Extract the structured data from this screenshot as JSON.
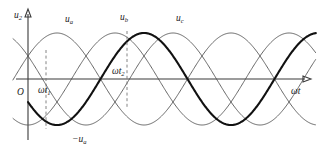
{
  "figure": {
    "title": "",
    "axes": {
      "y_label": "u",
      "y_label_sub": "2",
      "x_label": "ωt",
      "origin_label": "O"
    },
    "curve_labels": [
      {
        "name": "u",
        "sub": "a",
        "x": 69,
        "y": 22
      },
      {
        "name": "u",
        "sub": "b",
        "x": 124,
        "y": 20
      },
      {
        "name": "u",
        "sub": "c",
        "x": 180,
        "y": 21
      }
    ],
    "markers": [
      {
        "name": "ωt",
        "sub": "1",
        "x": 47,
        "y": 92
      },
      {
        "name": "ωt",
        "sub": "2",
        "x": 122,
        "y": 73
      }
    ],
    "bold_curve_label": {
      "name": "−u",
      "sub": "a",
      "x": 78,
      "y": 141
    },
    "colors": {
      "axis": "#3a3a3a",
      "wave": "#555555",
      "wave_bold": "#111111",
      "dash": "#777777",
      "background": "#ffffff"
    }
  },
  "chart_data": {
    "type": "line",
    "title": "",
    "xlabel": "ωt",
    "ylabel": "u2",
    "xlim": [
      0,
      6.2832
    ],
    "ylim": [
      -1.35,
      1.35
    ],
    "grid": false,
    "legend": "inline-curve-labels",
    "amplitude": 1.0,
    "period_degrees": 360,
    "phase_spacing_degrees": 120,
    "series": [
      {
        "name": "u_a",
        "phase_degrees": 30,
        "style": "thin",
        "color": "#555555",
        "description": "phase-a secondary voltage sinusoid"
      },
      {
        "name": "u_b",
        "phase_degrees": -90,
        "style": "thin",
        "color": "#555555",
        "description": "phase-b secondary voltage sinusoid, lags u_a by 120 degrees"
      },
      {
        "name": "u_c",
        "phase_degrees": 150,
        "style": "thin",
        "color": "#555555",
        "description": "phase-c secondary voltage sinusoid, leads u_a by 120 degrees"
      },
      {
        "name": "-u_a",
        "phase_degrees": 210,
        "style": "bold",
        "color": "#111111",
        "description": "inverted phase-a voltage, drawn with heavy stroke starting at the origin"
      }
    ],
    "annotations": [
      {
        "label": "ωt1",
        "type": "vertical-dashed",
        "x_degrees": 30,
        "note": "first firing angle reference, dashed line from u_a/-u_a intersection down past the trough"
      },
      {
        "label": "ωt2",
        "type": "vertical-dashed",
        "x_degrees": 180,
        "note": "second firing angle reference, dashed line through the -u_a peak"
      },
      {
        "label": "O",
        "type": "origin"
      }
    ]
  }
}
